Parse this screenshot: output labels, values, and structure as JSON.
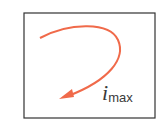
{
  "diagram": {
    "label": {
      "symbol": "i",
      "subscript": "max"
    },
    "colors": {
      "arrow": "#f06a4a",
      "frame": "#333333",
      "text": "#3a3a3a"
    }
  }
}
